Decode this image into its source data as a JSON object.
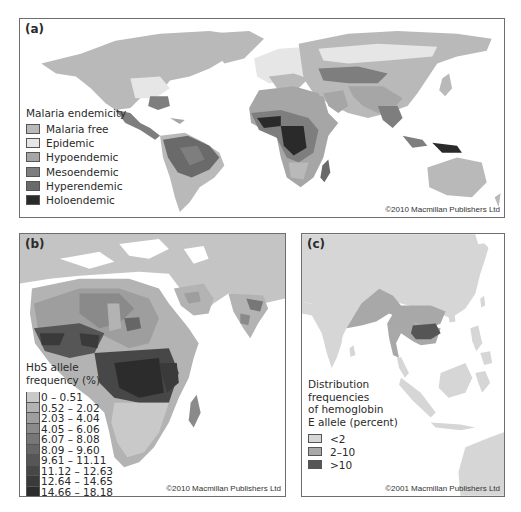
{
  "figure": {
    "panels": [
      {
        "id": "a",
        "label": "(a)",
        "legend_title": "Malaria endemicity",
        "legend": [
          {
            "label": "Malaria free",
            "color": "#b9b9b9"
          },
          {
            "label": "Epidemic",
            "color": "#e6e6e6"
          },
          {
            "label": "Hypoendemic",
            "color": "#a6a6a6"
          },
          {
            "label": "Mesoendemic",
            "color": "#7e7e7e"
          },
          {
            "label": "Hyperendemic",
            "color": "#6a6a6a"
          },
          {
            "label": "Holoendemic",
            "color": "#2a2a2a"
          }
        ],
        "credit": "©2010 Macmillan Publishers Ltd"
      },
      {
        "id": "b",
        "label": "(b)",
        "legend_title_line1": "HbS allele",
        "legend_title_line2": "frequency (%)",
        "legend": [
          {
            "label": "0 – 0.51",
            "color": "#c9c9c9"
          },
          {
            "label": "0.52 – 2.02",
            "color": "#b3b3b3"
          },
          {
            "label": "2.03 – 4.04",
            "color": "#9e9e9e"
          },
          {
            "label": "4.05 – 6.06",
            "color": "#8a8a8a"
          },
          {
            "label": "6.07 – 8.08",
            "color": "#777777"
          },
          {
            "label": "8.09 – 9.60",
            "color": "#666666"
          },
          {
            "label": "9.61 – 11.11",
            "color": "#565656"
          },
          {
            "label": "11.12 – 12.63",
            "color": "#474747"
          },
          {
            "label": "12.64 – 14.65",
            "color": "#3a3a3a"
          },
          {
            "label": "14.66 – 18.18",
            "color": "#2c2c2c"
          }
        ],
        "credit": "©2010 Macmillan Publishers Ltd"
      },
      {
        "id": "c",
        "label": "(c)",
        "legend_title_lines": [
          "Distribution",
          "frequencies",
          "of hemoglobin",
          "E allele (percent)"
        ],
        "legend": [
          {
            "label": "<2",
            "color": "#d6d6d6"
          },
          {
            "label": "2–10",
            "color": "#a8a8a8"
          },
          {
            "label": ">10",
            "color": "#555555"
          }
        ],
        "credit": "©2001 Macmillan Publishers Ltd"
      }
    ]
  }
}
